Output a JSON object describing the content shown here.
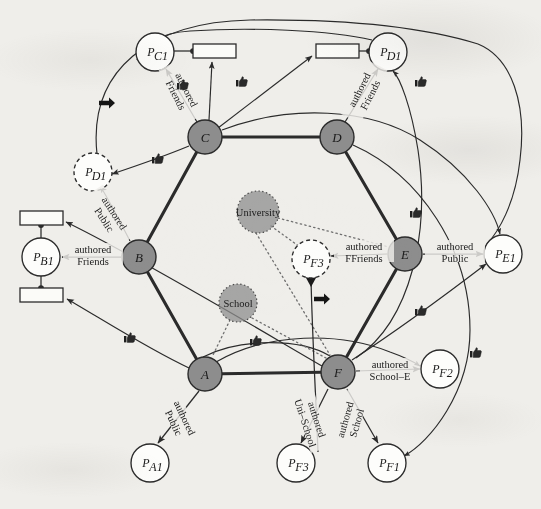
{
  "figure": {
    "background_color": "#efeeea",
    "node_fill": "#8d8d8d",
    "node_stroke": "#2b2b2b",
    "edge_color": "#2b2b2b",
    "dotted_color": "#707070"
  },
  "users": [
    {
      "id": "A",
      "label": "A",
      "cx": 205,
      "cy": 374,
      "r": 17
    },
    {
      "id": "B",
      "label": "B",
      "cx": 139,
      "cy": 257,
      "r": 17
    },
    {
      "id": "C",
      "label": "C",
      "cx": 205,
      "cy": 137,
      "r": 17
    },
    {
      "id": "D",
      "label": "D",
      "cx": 337,
      "cy": 137,
      "r": 17
    },
    {
      "id": "E",
      "label": "E",
      "cx": 405,
      "cy": 254,
      "r": 17
    },
    {
      "id": "F",
      "label": "F",
      "cx": 338,
      "cy": 372,
      "r": 17
    }
  ],
  "attributes": [
    {
      "id": "University",
      "label": "University",
      "cx": 258,
      "cy": 212,
      "r": 21
    },
    {
      "id": "School",
      "label": "School",
      "cx": 238,
      "cy": 303,
      "r": 19
    }
  ],
  "resources": [
    {
      "id": "PA1",
      "label": "P",
      "sub": "A1",
      "cx": 150,
      "cy": 463,
      "r": 19,
      "dashed": false
    },
    {
      "id": "PB1",
      "label": "P",
      "sub": "B1",
      "cx": 41,
      "cy": 257,
      "r": 19,
      "dashed": false
    },
    {
      "id": "PC1",
      "label": "P",
      "sub": "C1",
      "cx": 155,
      "cy": 52,
      "r": 19,
      "dashed": false
    },
    {
      "id": "PD1",
      "label": "P",
      "sub": "D1",
      "cx": 388,
      "cy": 52,
      "r": 19,
      "dashed": false
    },
    {
      "id": "PD1b",
      "label": "P",
      "sub": "D1",
      "cx": 93,
      "cy": 172,
      "r": 19,
      "dashed": true
    },
    {
      "id": "PE1",
      "label": "P",
      "sub": "E1",
      "cx": 503,
      "cy": 254,
      "r": 19,
      "dashed": false
    },
    {
      "id": "PF1",
      "label": "P",
      "sub": "F1",
      "cx": 387,
      "cy": 463,
      "r": 19,
      "dashed": false
    },
    {
      "id": "PF2",
      "label": "P",
      "sub": "F2",
      "cx": 440,
      "cy": 369,
      "r": 19,
      "dashed": false
    },
    {
      "id": "PF3",
      "label": "P",
      "sub": "F3",
      "cx": 311,
      "cy": 259,
      "r": 19,
      "dashed": true
    },
    {
      "id": "PF3b",
      "label": "P",
      "sub": "F3",
      "cx": 296,
      "cy": 463,
      "r": 19,
      "dashed": false
    }
  ],
  "policy_boxes": [
    {
      "id": "box-pc1",
      "x": 193,
      "y": 44,
      "w": 43,
      "h": 14
    },
    {
      "id": "box-pd1",
      "x": 316,
      "y": 44,
      "w": 43,
      "h": 14
    },
    {
      "id": "box-pb1-top",
      "x": 20,
      "y": 211,
      "w": 43,
      "h": 14
    },
    {
      "id": "box-pb1-bottom",
      "x": 20,
      "y": 288,
      "w": 43,
      "h": 14
    }
  ],
  "edge_labels": [
    {
      "id": "c-pc1",
      "line1": "authored",
      "line2": "Friends",
      "x": 182,
      "y": 92,
      "rot": 63
    },
    {
      "id": "d-pd1",
      "line1": "authored",
      "line2": "Friends",
      "x": 364,
      "y": 92,
      "rot": -63
    },
    {
      "id": "b-pd1b",
      "line1": "authored",
      "line2": "Public",
      "x": 110,
      "y": 216,
      "rot": 57
    },
    {
      "id": "b-pb1",
      "line1": "authored",
      "line2": "Friends",
      "x": 93,
      "y": 254,
      "rot": 0
    },
    {
      "id": "e-pf3",
      "line1": "authored",
      "line2": "FFriends",
      "x": 364,
      "y": 251,
      "rot": 0
    },
    {
      "id": "e-pe1",
      "line1": "authored",
      "line2": "Public",
      "x": 455,
      "y": 251,
      "rot": 0
    },
    {
      "id": "a-pa1",
      "line1": "authored",
      "line2": "Public",
      "x": 180,
      "y": 420,
      "rot": 65
    },
    {
      "id": "f-pf2",
      "line1": "authored",
      "line2": "School–E",
      "x": 390,
      "y": 369,
      "rot": 0
    },
    {
      "id": "f-pf3b",
      "line1": "authored",
      "line2": "Uni–School",
      "x": 312,
      "y": 421,
      "rot": 72
    },
    {
      "id": "f-pf1",
      "line1": "authored",
      "line2": "School",
      "x": 350,
      "y": 421,
      "rot": -74
    }
  ],
  "markers": {
    "arrow_glyphs": [
      {
        "id": "arrow-top-left",
        "x": 108,
        "y": 103
      },
      {
        "id": "arrow-center",
        "x": 323,
        "y": 299
      }
    ],
    "hand_glyphs": [
      {
        "id": "hand-c-box",
        "x": 177,
        "y": 83
      },
      {
        "id": "hand-c-pd1",
        "x": 236,
        "y": 80
      },
      {
        "id": "hand-c-left",
        "x": 152,
        "y": 157
      },
      {
        "id": "hand-d-pd1",
        "x": 415,
        "y": 80
      },
      {
        "id": "hand-e-upper",
        "x": 410,
        "y": 211
      },
      {
        "id": "hand-b-left",
        "x": 124,
        "y": 336
      },
      {
        "id": "hand-school",
        "x": 250,
        "y": 339
      },
      {
        "id": "hand-f-right",
        "x": 415,
        "y": 309
      },
      {
        "id": "hand-e-right",
        "x": 470,
        "y": 351
      }
    ]
  }
}
